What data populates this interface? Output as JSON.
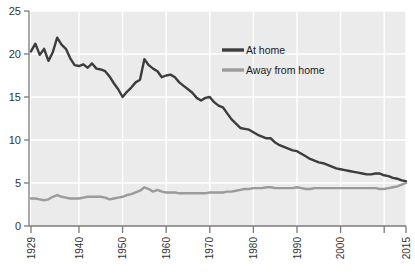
{
  "chart_data": {
    "type": "line",
    "title": "",
    "subtitle": "",
    "xlabel": "",
    "ylabel": "",
    "xlim": [
      1929,
      2015
    ],
    "ylim": [
      0,
      25
    ],
    "grid": true,
    "legend_position": "top-right",
    "y_ticks": [
      "0",
      "5",
      "10",
      "15",
      "20",
      "25"
    ],
    "y_tick_values": [
      0,
      5,
      10,
      15,
      20,
      25
    ],
    "x_ticks": [
      "1929",
      "1940",
      "1950",
      "1960",
      "1970",
      "1980",
      "1990",
      "2000",
      "2015"
    ],
    "x_tick_values": [
      1929,
      1940,
      1950,
      1960,
      1970,
      1980,
      1990,
      2000,
      2015
    ],
    "x_tick_extra_unlabeled": [
      2010
    ],
    "colors": {
      "at_home": "#3d3d3d",
      "away_from_home": "#9b9b9b",
      "plot_background": "#ebebeb",
      "gridline": "#ffffff",
      "axis": "#7a7a7a"
    },
    "x": [
      1929,
      1930,
      1931,
      1932,
      1933,
      1934,
      1935,
      1936,
      1937,
      1938,
      1939,
      1940,
      1941,
      1942,
      1943,
      1944,
      1945,
      1946,
      1947,
      1948,
      1949,
      1950,
      1951,
      1952,
      1953,
      1954,
      1955,
      1956,
      1957,
      1958,
      1959,
      1960,
      1961,
      1962,
      1963,
      1964,
      1965,
      1966,
      1967,
      1968,
      1969,
      1970,
      1971,
      1972,
      1973,
      1974,
      1975,
      1976,
      1977,
      1978,
      1979,
      1980,
      1981,
      1982,
      1983,
      1984,
      1985,
      1986,
      1987,
      1988,
      1989,
      1990,
      1991,
      1992,
      1993,
      1994,
      1995,
      1996,
      1997,
      1998,
      1999,
      2000,
      2001,
      2002,
      2003,
      2004,
      2005,
      2006,
      2007,
      2008,
      2009,
      2010,
      2011,
      2012,
      2013,
      2014,
      2015
    ],
    "series": [
      {
        "name": "At home",
        "color": "#3d3d3d",
        "values": [
          20.3,
          21.2,
          19.9,
          20.6,
          19.2,
          20.2,
          21.9,
          21.1,
          20.6,
          19.5,
          18.7,
          18.6,
          18.8,
          18.4,
          18.9,
          18.3,
          18.2,
          18.0,
          17.4,
          16.6,
          15.9,
          15.0,
          15.6,
          16.1,
          16.7,
          17.0,
          19.4,
          18.7,
          18.3,
          18.0,
          17.3,
          17.5,
          17.6,
          17.3,
          16.7,
          16.3,
          15.9,
          15.5,
          14.9,
          14.6,
          14.9,
          15.0,
          14.4,
          14.0,
          13.8,
          13.1,
          12.4,
          11.9,
          11.4,
          11.3,
          11.2,
          10.9,
          10.6,
          10.4,
          10.2,
          10.2,
          9.7,
          9.4,
          9.2,
          9.0,
          8.8,
          8.7,
          8.4,
          8.1,
          7.8,
          7.6,
          7.4,
          7.3,
          7.1,
          6.9,
          6.7,
          6.6,
          6.5,
          6.4,
          6.3,
          6.2,
          6.1,
          6.0,
          6.0,
          6.1,
          6.1,
          5.9,
          5.8,
          5.6,
          5.5,
          5.3,
          5.2
        ]
      },
      {
        "name": "Away from home",
        "color": "#9b9b9b",
        "values": [
          3.2,
          3.2,
          3.1,
          3.0,
          3.1,
          3.4,
          3.6,
          3.4,
          3.3,
          3.2,
          3.2,
          3.2,
          3.3,
          3.4,
          3.4,
          3.4,
          3.4,
          3.3,
          3.1,
          3.2,
          3.3,
          3.4,
          3.6,
          3.7,
          3.9,
          4.1,
          4.5,
          4.3,
          4.0,
          4.2,
          4.0,
          3.9,
          3.9,
          3.9,
          3.8,
          3.8,
          3.8,
          3.8,
          3.8,
          3.8,
          3.8,
          3.9,
          3.9,
          3.9,
          3.9,
          4.0,
          4.0,
          4.1,
          4.2,
          4.3,
          4.3,
          4.4,
          4.4,
          4.4,
          4.5,
          4.5,
          4.4,
          4.4,
          4.4,
          4.4,
          4.4,
          4.5,
          4.4,
          4.3,
          4.3,
          4.4,
          4.4,
          4.4,
          4.4,
          4.4,
          4.4,
          4.4,
          4.4,
          4.4,
          4.4,
          4.4,
          4.4,
          4.4,
          4.4,
          4.4,
          4.3,
          4.3,
          4.4,
          4.5,
          4.6,
          4.8,
          5.0
        ]
      }
    ]
  },
  "legend": {
    "items": [
      {
        "label": "At home",
        "color": "#3d3d3d"
      },
      {
        "label": "Away from home",
        "color": "#9b9b9b"
      }
    ]
  }
}
